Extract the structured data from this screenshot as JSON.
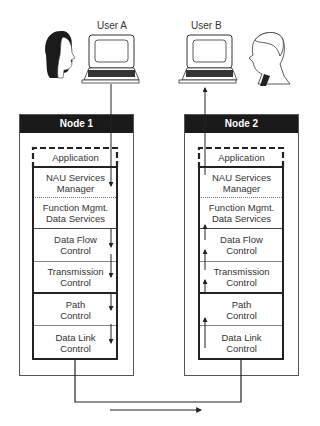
{
  "users": [
    {
      "id": "user-a",
      "label": "User A"
    },
    {
      "id": "user-b",
      "label": "User B"
    }
  ],
  "nodes": [
    {
      "title": "Node 1",
      "data_direction": "down",
      "layers": [
        {
          "label": "Application"
        },
        {
          "label": "NAU Services Manager"
        },
        {
          "label": "Function Mgmt. Data Services"
        },
        {
          "label": "Data Flow Control"
        },
        {
          "label": "Transmission Control"
        },
        {
          "label": "Path Control"
        },
        {
          "label": "Data Link Control"
        }
      ]
    },
    {
      "title": "Node 2",
      "data_direction": "up",
      "layers": [
        {
          "label": "Application"
        },
        {
          "label": "NAU Services Manager"
        },
        {
          "label": "Function Mgmt. Data Services"
        },
        {
          "label": "Data Flow Control"
        },
        {
          "label": "Transmission Control"
        },
        {
          "label": "Path Control"
        },
        {
          "label": "Data Link Control"
        }
      ]
    }
  ],
  "layer_lines": {
    "nau_line1": "NAU Services",
    "nau_line2": "Manager",
    "fm_line1": "Function Mgmt.",
    "fm_line2": "Data Services",
    "dfc_line1": "Data Flow",
    "dfc_line2": "Control",
    "tc_line1": "Transmission",
    "tc_line2": "Control",
    "pc_line1": "Path",
    "pc_line2": "Control",
    "dlc_line1": "Data Link",
    "dlc_line2": "Control"
  },
  "link": {
    "direction": "left-to-right"
  },
  "colors": {
    "header_bg": "#1a1a1a",
    "line": "#222222",
    "border": "#555555"
  }
}
